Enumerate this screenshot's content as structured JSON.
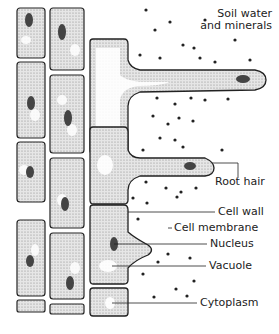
{
  "diagram": {
    "labels": {
      "soil_water": [
        "Soil water",
        "and minerals"
      ],
      "root_hair": "Root hair",
      "cell_wall": "Cell wall",
      "cell_membrane": "Cell membrane",
      "nucleus": "Nucleus",
      "vacuole": "Vacuole",
      "cytoplasm": "Cytoplasm"
    },
    "colors": {
      "line": "#222222",
      "cytoplasm": "#d6d6d6",
      "nucleus": "#555555",
      "background": "#ffffff"
    }
  }
}
